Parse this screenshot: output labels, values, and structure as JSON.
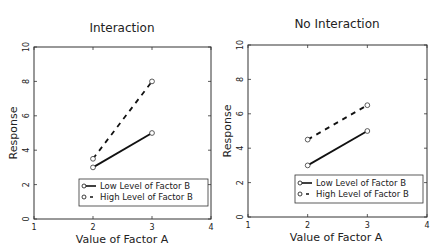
{
  "chart_data": [
    {
      "type": "line",
      "title": "Interaction",
      "xlabel": "Value of Factor A",
      "ylabel": "Response",
      "xlim": [
        1,
        4
      ],
      "ylim": [
        0,
        10
      ],
      "xticks": [
        1,
        2,
        3,
        4
      ],
      "yticks": [
        0,
        2,
        4,
        6,
        8,
        10
      ],
      "grid": false,
      "legend_position": "lower right",
      "x": [
        2,
        3
      ],
      "series": [
        {
          "name": "Low Level of Factor B",
          "values": [
            3,
            5
          ],
          "style": "solid",
          "marker": "circle",
          "color": "#111111"
        },
        {
          "name": "High Level of Factor B",
          "values": [
            3.5,
            8
          ],
          "style": "dashed",
          "marker": "circle",
          "color": "#111111"
        }
      ]
    },
    {
      "type": "line",
      "title": "No Interaction",
      "xlabel": "Value of Factor A",
      "ylabel": "Response",
      "xlim": [
        1,
        4
      ],
      "ylim": [
        0,
        10
      ],
      "xticks": [
        1,
        2,
        3,
        4
      ],
      "yticks": [
        0,
        2,
        4,
        6,
        8,
        10
      ],
      "grid": false,
      "legend_position": "lower right",
      "x": [
        2,
        3
      ],
      "series": [
        {
          "name": "Low Level of Factor B",
          "values": [
            3,
            5
          ],
          "style": "solid",
          "marker": "circle",
          "color": "#111111"
        },
        {
          "name": "High Level of Factor B",
          "values": [
            4.5,
            6.5
          ],
          "style": "dashed",
          "marker": "circle",
          "color": "#111111"
        }
      ]
    }
  ],
  "panels": [
    {
      "title": "Interaction",
      "xlabel": "Value of Factor A",
      "ylabel": "Response",
      "legend": [
        "Low Level of Factor B",
        "High Level of Factor B"
      ]
    },
    {
      "title": "No Interaction",
      "xlabel": "Value of Factor A",
      "ylabel": "Response",
      "legend": [
        "Low Level of Factor B",
        "High Level of Factor B"
      ]
    }
  ]
}
